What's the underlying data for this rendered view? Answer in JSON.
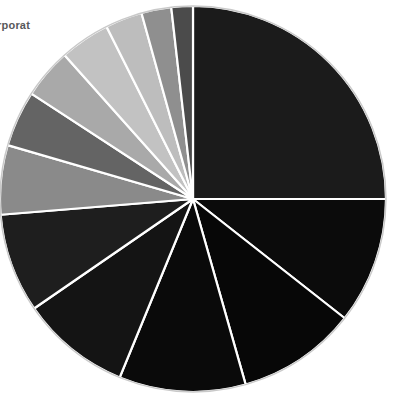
{
  "corner_text": "Corporat",
  "canvas": {
    "width": 394,
    "height": 403,
    "background": "#ffffff"
  },
  "pie_geometry": {
    "center_x": 193,
    "center_y": 199,
    "radius": 193,
    "start_angle_deg": -90,
    "direction": "clockwise",
    "separator_color": "#ffffff",
    "separator_width": 2.2,
    "outline_color": "#c9c9c9",
    "outline_width": 1.4
  },
  "chart_data": {
    "type": "pie",
    "title": "",
    "subtitle": "",
    "xlabel": "",
    "ylabel": "",
    "grid": false,
    "legend_position": "none",
    "total": 100,
    "labels": [
      "Slice 1",
      "Slice 2",
      "Slice 3",
      "Slice 4",
      "Slice 5",
      "Slice 6",
      "Slice 7",
      "Slice 8",
      "Slice 9",
      "Slice 10",
      "Slice 11",
      "Slice 12",
      "Slice 13"
    ],
    "values": [
      25.0,
      10.6,
      10.0,
      10.6,
      9.2,
      8.3,
      5.8,
      4.7,
      4.2,
      4.2,
      3.1,
      2.5,
      1.8
    ],
    "colors": [
      "#1b1b1b",
      "#0b0b0b",
      "#070707",
      "#0a0a0a",
      "#141414",
      "#1e1e1e",
      "#8a8a8a",
      "#646464",
      "#a9a9a9",
      "#c2c2c2",
      "#bdbdbd",
      "#8f8f8f",
      "#4b4b4b",
      "#2a2a2a"
    ],
    "annotations": []
  }
}
